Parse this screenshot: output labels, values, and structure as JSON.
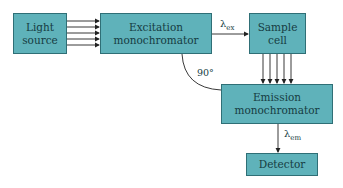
{
  "diagram": {
    "type": "spectrofluorometer-block-diagram",
    "colors": {
      "box_fill": "#5fb2ba",
      "box_border": "#2f6f76",
      "text": "#163c42",
      "line": "#222222"
    },
    "nodes": {
      "light_source": {
        "line1": "Light",
        "line2": "source"
      },
      "excitation": {
        "line1": "Excitation",
        "line2": "monochromator"
      },
      "sample": {
        "line1": "Sample",
        "line2": "cell"
      },
      "emission": {
        "line1": "Emission",
        "line2": "monochromator"
      },
      "detector": {
        "line1": "Detector"
      }
    },
    "labels": {
      "lambda": "λ",
      "ex_sub": "ex",
      "em_sub": "em",
      "angle": "90°"
    },
    "edges": [
      {
        "from": "light_source",
        "to": "excitation",
        "arrows": 5
      },
      {
        "from": "excitation",
        "to": "sample",
        "label": "λex"
      },
      {
        "from": "sample",
        "to": "emission",
        "arrows": 5
      },
      {
        "from": "emission",
        "to": "detector",
        "label": "λem"
      },
      {
        "from": "excitation",
        "to": "emission",
        "style": "arc",
        "label": "90°"
      }
    ]
  }
}
